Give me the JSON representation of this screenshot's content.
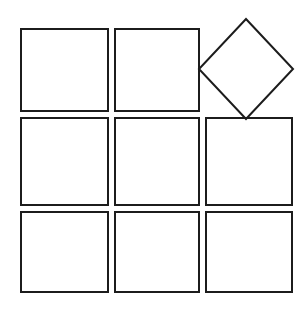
{
  "figure": {
    "canvas": {
      "width": 306,
      "height": 313,
      "background_color": "#ffffff"
    },
    "style": {
      "stroke_color": "#1c1c1c",
      "stroke_width": 2,
      "fill_color": "none",
      "line_join": "miter"
    },
    "grid": {
      "rows": 3,
      "columns": 3,
      "column_left_edges": [
        21,
        115,
        206
      ],
      "column_right_edges": [
        108,
        199,
        292
      ],
      "row_top_edges": [
        29,
        118,
        212
      ],
      "row_bottom_edges": [
        111,
        205,
        292
      ],
      "missing_cell": {
        "row": 1,
        "column": 3
      }
    },
    "shapes": [
      {
        "id": "square-r1c1",
        "type": "square",
        "label": "Square row 1 column 1",
        "x": 21,
        "y": 29,
        "width": 87,
        "height": 82,
        "rotation_deg": 0
      },
      {
        "id": "square-r1c2",
        "type": "square",
        "label": "Square row 1 column 2",
        "x": 115,
        "y": 29,
        "width": 84,
        "height": 82,
        "rotation_deg": 0
      },
      {
        "id": "square-r2c1",
        "type": "square",
        "label": "Square row 2 column 1",
        "x": 21,
        "y": 118,
        "width": 87,
        "height": 87,
        "rotation_deg": 0
      },
      {
        "id": "square-r2c2",
        "type": "square",
        "label": "Square row 2 column 2",
        "x": 115,
        "y": 118,
        "width": 84,
        "height": 87,
        "rotation_deg": 0
      },
      {
        "id": "square-r2c3",
        "type": "square",
        "label": "Square row 2 column 3",
        "x": 206,
        "y": 118,
        "width": 86,
        "height": 87,
        "rotation_deg": 0
      },
      {
        "id": "square-r3c1",
        "type": "square",
        "label": "Square row 3 column 1",
        "x": 21,
        "y": 212,
        "width": 87,
        "height": 80,
        "rotation_deg": 0
      },
      {
        "id": "square-r3c2",
        "type": "square",
        "label": "Square row 3 column 2",
        "x": 115,
        "y": 212,
        "width": 84,
        "height": 80,
        "rotation_deg": 0
      },
      {
        "id": "square-r3c3",
        "type": "square",
        "label": "Square row 3 column 3",
        "x": 206,
        "y": 212,
        "width": 86,
        "height": 80,
        "rotation_deg": 0
      },
      {
        "id": "diamond-r1c3",
        "type": "rotated-square",
        "label": "Rotated square (diamond) at row 1 column 3",
        "center_x": 246,
        "center_y": 69,
        "half_diagonal_x": 47,
        "half_diagonal_y": 50,
        "rotation_deg": 45,
        "vertices": [
          {
            "name": "top",
            "x": 246,
            "y": 19
          },
          {
            "name": "right",
            "x": 293,
            "y": 69
          },
          {
            "name": "bottom",
            "x": 246,
            "y": 119
          },
          {
            "name": "left",
            "x": 199,
            "y": 69
          }
        ]
      }
    ],
    "counts": {
      "total_shapes": 9,
      "axis_aligned_squares": 8,
      "rotated_squares": 1
    }
  }
}
